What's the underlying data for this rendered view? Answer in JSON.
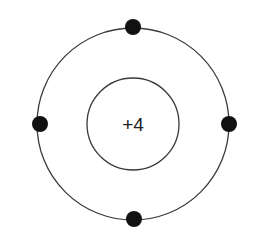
{
  "diagram": {
    "type": "bohr-atom-model",
    "nucleus": {
      "label": "+4",
      "center": [
        133,
        124
      ],
      "radius": 46
    },
    "shells": [
      {
        "index": 1,
        "center": [
          133,
          124
        ],
        "radius": 96,
        "electron_count": 4,
        "electrons": [
          {
            "position": "top",
            "x": 133,
            "y": 27
          },
          {
            "position": "left",
            "x": 40,
            "y": 124
          },
          {
            "position": "right",
            "x": 229,
            "y": 124
          },
          {
            "position": "bottom",
            "x": 134,
            "y": 219
          }
        ]
      }
    ],
    "colors": {
      "background": "#ffffff",
      "stroke": "#3a3a3a",
      "electron": "#111111",
      "text": "#222222"
    }
  }
}
